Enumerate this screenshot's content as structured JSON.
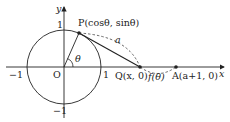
{
  "diagram": {
    "axes": {
      "x_label": "x",
      "y_label": "y",
      "origin_label": "O"
    },
    "ticks": {
      "x_neg": "−1",
      "x_pos": "1",
      "y_pos": "1",
      "y_neg": "−1"
    },
    "points": {
      "P": "P(cosθ, sinθ)",
      "Q": "Q(x, 0)",
      "A": "A(a+1, 0)"
    },
    "angle_label": "θ",
    "arc_label_a": "a",
    "arc_label_f": "f(θ)",
    "colors": {
      "stroke": "#222222",
      "background": "#ffffff"
    }
  }
}
